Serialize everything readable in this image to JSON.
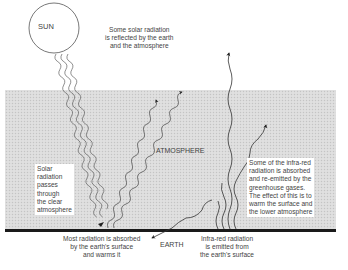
{
  "diagram": {
    "type": "greenhouse-effect",
    "labels": {
      "sun": "SUN",
      "atmosphere": "ATMOSPHERE",
      "earth": "EARTH",
      "reflected": [
        "Some solar radiation",
        "is reflected by the earth",
        "and the atmosphere"
      ],
      "passes": [
        "Solar",
        "radiation",
        "passes",
        "through",
        "the clear",
        "atmosphere"
      ],
      "absorbed": [
        "Most radiation is absorbed",
        "by the earth's surface",
        "and warms it"
      ],
      "infrared_emitted": [
        "Infra-red radiation",
        "is emitted from",
        "the earth's surface"
      ],
      "greenhouse": [
        "Some of the infra-red",
        "radiation is absorbed",
        "and re-emitted by the",
        "greenhouse gases.",
        "The effect of this is to",
        "warm the surface and",
        "the lower atmosphere"
      ]
    },
    "colors": {
      "atmosphere": "#dcdcdc",
      "ground": "#1a1a1a",
      "lines": "#333333",
      "background": "#ffffff"
    }
  }
}
